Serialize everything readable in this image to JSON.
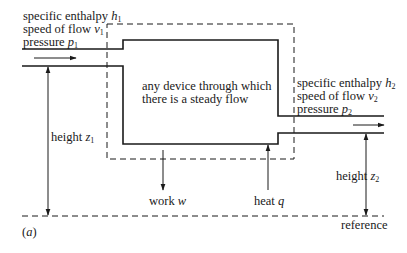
{
  "inlet": {
    "line1": "specific enthalpy ",
    "line1_var": "h",
    "line1_sub": "1",
    "line2": "speed of flow ",
    "line2_var": "v",
    "line2_sub": "1",
    "line3": "pressure ",
    "line3_var": "p",
    "line3_sub": "1"
  },
  "outlet": {
    "line1": "specific enthalpy ",
    "line1_var": "h",
    "line1_sub": "2",
    "line2": "speed of flow ",
    "line2_var": "v",
    "line2_sub": "2",
    "line3": "pressure ",
    "line3_var": "p",
    "line3_sub": "2"
  },
  "device": {
    "line1": "any device through which",
    "line2": "there is a steady flow"
  },
  "height1": {
    "text": "height ",
    "var": "z",
    "sub": "1"
  },
  "height2": {
    "text": "height ",
    "var": "z",
    "sub": "2"
  },
  "work": {
    "text": "work ",
    "var": "w"
  },
  "heat": {
    "text": "heat ",
    "var": "q"
  },
  "reference": "reference",
  "figure_label": {
    "open": "(",
    "var": "a",
    "close": ")"
  },
  "colors": {
    "ink": "#1a1a1a",
    "background": "#ffffff"
  }
}
